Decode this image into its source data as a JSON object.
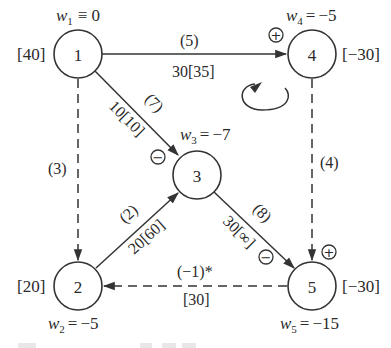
{
  "diagram": {
    "type": "network-flow-graph",
    "nodes": [
      {
        "id": "1",
        "label": "1",
        "weight_symbol": "w",
        "weight_index": "1",
        "weight_relation": "≡",
        "weight_value": "0",
        "supply": "[40]"
      },
      {
        "id": "2",
        "label": "2",
        "weight_symbol": "w",
        "weight_index": "2",
        "weight_relation": "=",
        "weight_value": "−5",
        "supply": "[20]"
      },
      {
        "id": "3",
        "label": "3",
        "weight_symbol": "w",
        "weight_index": "3",
        "weight_relation": "=",
        "weight_value": "−7",
        "supply": ""
      },
      {
        "id": "4",
        "label": "4",
        "weight_symbol": "w",
        "weight_index": "4",
        "weight_relation": "=",
        "weight_value": "−5",
        "supply": "[−30]"
      },
      {
        "id": "5",
        "label": "5",
        "weight_symbol": "w",
        "weight_index": "5",
        "weight_relation": "=",
        "weight_value": "−15",
        "supply": "[−30]"
      }
    ],
    "edges": [
      {
        "id": "e1-4",
        "from": "1",
        "to": "4",
        "style": "solid",
        "cost": "(5)",
        "flow": "30[35]"
      },
      {
        "id": "e1-3",
        "from": "1",
        "to": "3",
        "style": "solid",
        "cost": "(7)",
        "flow": "10[10]"
      },
      {
        "id": "e1-2",
        "from": "1",
        "to": "2",
        "style": "dashed",
        "cost": "(3)",
        "flow": ""
      },
      {
        "id": "e2-3",
        "from": "2",
        "to": "3",
        "style": "solid",
        "cost": "(2)",
        "flow": "20[60]"
      },
      {
        "id": "e3-5",
        "from": "3",
        "to": "5",
        "style": "solid",
        "cost": "(8)",
        "flow": "30[∞]"
      },
      {
        "id": "e4-5",
        "from": "4",
        "to": "5",
        "style": "dashed",
        "cost": "(4)",
        "flow": ""
      },
      {
        "id": "e5-2",
        "from": "5",
        "to": "2",
        "style": "dashed",
        "cost": "(−1)*",
        "flow": "[30]"
      }
    ],
    "cycle_signs": [
      {
        "near": "node-4",
        "sign": "+"
      },
      {
        "near": "node-3",
        "sign": "−"
      },
      {
        "near": "edge-3-5",
        "sign": "−"
      },
      {
        "near": "node-5",
        "sign": "+"
      }
    ],
    "cycle_direction_icon": "clockwise-arrow"
  }
}
